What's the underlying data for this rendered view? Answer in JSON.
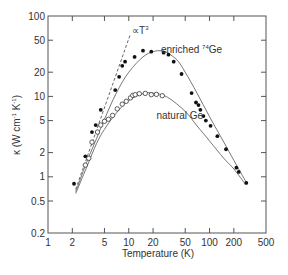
{
  "chart_data": {
    "type": "scatter",
    "title": "",
    "xlabel": "Temperature (K)",
    "ylabel": "κ (W cm⁻¹ K⁻¹)",
    "xscale": "log",
    "yscale": "log",
    "xlim": [
      1,
      500
    ],
    "ylim": [
      0.2,
      100
    ],
    "x_ticks": [
      1,
      2,
      5,
      10,
      20,
      50,
      100,
      200,
      500
    ],
    "x_tick_labels": [
      "1",
      "2",
      "5",
      "10",
      "20",
      "50",
      "100",
      "200",
      "500"
    ],
    "y_ticks": [
      0.2,
      0.5,
      1,
      2,
      5,
      10,
      20,
      50,
      100
    ],
    "y_tick_labels": [
      "0.2",
      "0.5",
      "1",
      "2",
      "5",
      "10",
      "20",
      "50",
      "100"
    ],
    "grid": false,
    "legend": "none (inline labels)",
    "annotations": [
      {
        "text": "∝T",
        "sup": "3",
        "x": 11,
        "y": 60
      },
      {
        "text": "enriched ",
        "sup": "74",
        "suffix": "Ge",
        "x": 25,
        "y": 35
      },
      {
        "text": "natural Ge",
        "x": 22,
        "y": 5.2
      }
    ],
    "series": [
      {
        "name": "enriched 74Ge",
        "marker": "filled-circle",
        "points": [
          [
            2.1,
            0.82
          ],
          [
            2.9,
            1.8
          ],
          [
            3.5,
            3.6
          ],
          [
            3.9,
            4.4
          ],
          [
            4.5,
            6.8
          ],
          [
            6.8,
            12.0
          ],
          [
            7.6,
            17.5
          ],
          [
            8.3,
            24.0
          ],
          [
            9.0,
            27.0
          ],
          [
            11.8,
            31.0
          ],
          [
            15.0,
            37.0
          ],
          [
            19.0,
            36.0
          ],
          [
            27.0,
            35.0
          ],
          [
            31.0,
            33.0
          ],
          [
            36.0,
            27.0
          ],
          [
            45.0,
            19.0
          ],
          [
            60.0,
            11.0
          ],
          [
            68.0,
            8.4
          ],
          [
            73.0,
            7.8
          ],
          [
            77.0,
            6.8
          ],
          [
            84.0,
            5.7
          ],
          [
            90.0,
            5.0
          ],
          [
            103.0,
            4.3
          ],
          [
            125.0,
            3.2
          ],
          [
            160.0,
            2.2
          ],
          [
            215.0,
            1.3
          ],
          [
            230.0,
            1.15
          ],
          [
            285.0,
            0.84
          ]
        ],
        "fit_curve": [
          [
            2.2,
            0.65
          ],
          [
            3,
            1.5
          ],
          [
            4,
            3.0
          ],
          [
            5,
            5.2
          ],
          [
            7,
            11
          ],
          [
            10,
            20
          ],
          [
            15,
            31
          ],
          [
            20,
            36
          ],
          [
            25,
            37
          ],
          [
            30,
            35
          ],
          [
            40,
            28
          ],
          [
            50,
            20
          ],
          [
            70,
            11
          ],
          [
            100,
            5.6
          ],
          [
            150,
            2.7
          ],
          [
            200,
            1.6
          ],
          [
            285,
            0.85
          ]
        ]
      },
      {
        "name": "natural Ge",
        "marker": "open-circle",
        "points": [
          [
            2.9,
            1.4
          ],
          [
            3.2,
            1.7
          ],
          [
            3.5,
            2.7
          ],
          [
            4.1,
            3.6
          ],
          [
            4.5,
            4.4
          ],
          [
            5.0,
            4.9
          ],
          [
            5.6,
            5.2
          ],
          [
            6.3,
            5.8
          ],
          [
            7.2,
            7.0
          ],
          [
            8.3,
            8.0
          ],
          [
            9.3,
            8.7
          ],
          [
            10.5,
            9.6
          ],
          [
            11.2,
            10.3
          ],
          [
            12.0,
            10.5
          ],
          [
            13.5,
            10.8
          ],
          [
            16.0,
            10.9
          ],
          [
            19.0,
            10.5
          ],
          [
            22.0,
            10.6
          ],
          [
            26.0,
            10.2
          ]
        ],
        "fit_curve": [
          [
            2.2,
            0.62
          ],
          [
            3,
            1.3
          ],
          [
            4,
            2.6
          ],
          [
            5,
            3.9
          ],
          [
            7,
            6.2
          ],
          [
            10,
            8.9
          ],
          [
            15,
            10.8
          ],
          [
            20,
            11.0
          ],
          [
            30,
            9.8
          ],
          [
            50,
            6.5
          ],
          [
            70,
            4.3
          ],
          [
            100,
            2.8
          ],
          [
            150,
            1.7
          ],
          [
            200,
            1.25
          ],
          [
            280,
            0.8
          ]
        ]
      },
      {
        "name": "∝T³",
        "style": "dashed-line",
        "points": [
          [
            2.2,
            0.7
          ],
          [
            10.5,
            60
          ]
        ]
      }
    ]
  }
}
